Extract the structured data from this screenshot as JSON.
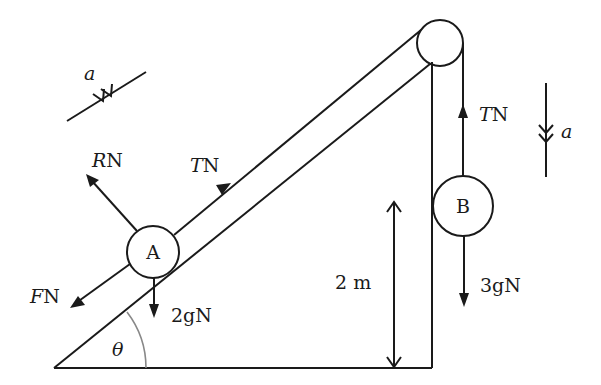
{
  "diagram": {
    "particles": {
      "A": {
        "label": "A",
        "mass_weight": "2gN"
      },
      "B": {
        "label": "B",
        "mass_weight": "3gN"
      }
    },
    "forces": {
      "normal_A": {
        "symbol": "R",
        "unit": "N"
      },
      "tension_A": {
        "symbol": "T",
        "unit": "N"
      },
      "friction_A": {
        "symbol": "F",
        "unit": "N"
      },
      "weight_A": {
        "text": "2gN"
      },
      "tension_B": {
        "symbol": "T",
        "unit": "N"
      },
      "weight_B": {
        "text": "3gN"
      }
    },
    "acceleration": {
      "incline": {
        "symbol": "a"
      },
      "vertical": {
        "symbol": "a"
      }
    },
    "angle": {
      "symbol": "θ"
    },
    "height": {
      "text": "2 m"
    }
  },
  "colors": {
    "line": "#1a1a1a",
    "angle_arc": "#888888",
    "background": "#ffffff"
  }
}
